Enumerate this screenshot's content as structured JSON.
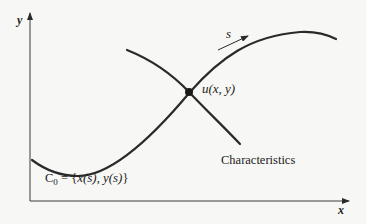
{
  "diagram": {
    "axes": {
      "x_label": "x",
      "y_label": "y"
    },
    "curve_label": {
      "prefix": "C",
      "subscript": "0",
      "equals": " = ",
      "set_open": "{",
      "x_of_s": "x(s)",
      "comma": ", ",
      "y_of_s": "y(s)",
      "set_close": "}"
    },
    "direction_label": "s",
    "point_label": "u(x, y)",
    "characteristics_label": "Characteristics",
    "colors": {
      "background": "#f7f7f5",
      "stroke": "#2a2a2a",
      "text": "#222222"
    }
  }
}
